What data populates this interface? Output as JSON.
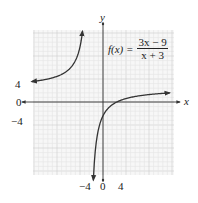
{
  "chart_data": {
    "type": "line",
    "title": "",
    "function_label": "f(x) =",
    "numerator": "3x − 9",
    "denominator": "x + 3",
    "xlabel": "x",
    "ylabel": "y",
    "x_tick_labels": [
      "−4",
      "0",
      "4"
    ],
    "y_tick_labels": [
      "4",
      "0",
      "−4"
    ],
    "x_ticks": [
      -4,
      0,
      4
    ],
    "y_ticks": [
      4,
      0,
      -4
    ],
    "xlim": [
      -15,
      15
    ],
    "ylim": [
      -15,
      15
    ],
    "grid": true,
    "asymptotes": {
      "vertical": -3,
      "horizontal": 3
    },
    "series": [
      {
        "name": "left branch",
        "x": [
          -15,
          -12,
          -10,
          -8,
          -6,
          -5,
          -4.5,
          -4,
          -3.8
        ],
        "y": [
          4.5,
          5,
          5.57,
          6.6,
          9,
          12,
          15,
          21,
          25.5
        ]
      },
      {
        "name": "right branch",
        "x": [
          -2.2,
          -2.5,
          -2,
          -1,
          0,
          1,
          3,
          5,
          8,
          12,
          15
        ],
        "y": [
          -16.5,
          -33,
          -15,
          -6,
          -3,
          -1.5,
          0,
          0.75,
          1.36,
          1.8,
          2
        ]
      }
    ],
    "legend": null
  },
  "colors": {
    "curve": "#333333",
    "axis": "#333333",
    "grid_minor": "#e4e4e4",
    "grid_major": "#cfcfcf",
    "background": "#ffffff"
  }
}
